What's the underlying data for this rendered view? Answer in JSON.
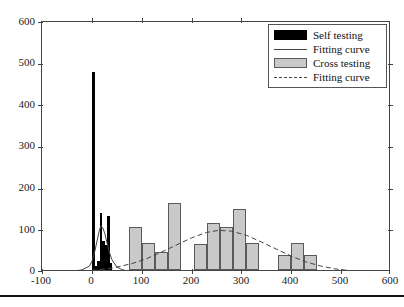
{
  "figure": {
    "background": "#ffffff",
    "frame_color": "#444444"
  },
  "legend": {
    "position": "top-right",
    "items": [
      {
        "label": "Self testing",
        "key": "filled-black-box",
        "color": "#000000"
      },
      {
        "label": "Fitting curve",
        "key": "solid-line",
        "color": "#444444"
      },
      {
        "label": "Cross testing",
        "key": "filled-gray-box",
        "color": "#c9c9c9"
      },
      {
        "label": "Fitting curve",
        "key": "dashed-line",
        "color": "#444444"
      }
    ]
  },
  "axes": {
    "x": {
      "min": -100,
      "max": 600,
      "ticks": [
        -100,
        0,
        100,
        200,
        300,
        400,
        500,
        600
      ],
      "tick_labels": [
        "-100",
        "0",
        "100",
        "200",
        "300",
        "400",
        "500",
        "600"
      ],
      "label": ""
    },
    "y": {
      "min": 0,
      "max": 600,
      "ticks": [
        0,
        100,
        200,
        300,
        400,
        500,
        600
      ],
      "tick_labels": [
        "0",
        "100",
        "200",
        "300",
        "400",
        "500",
        "600"
      ],
      "label": ""
    }
  },
  "chart_data": {
    "type": "bar",
    "title": "",
    "xlabel": "",
    "ylabel": "",
    "xlim": [
      -100,
      600
    ],
    "ylim": [
      0,
      600
    ],
    "grid": false,
    "legend_position": "top-right",
    "series": [
      {
        "name": "Self testing",
        "type": "bar",
        "color": "#000000",
        "bin_width": 5,
        "x": [
          3,
          8,
          13,
          18,
          23,
          28,
          33,
          38
        ],
        "values": [
          475,
          10,
          22,
          138,
          70,
          60,
          130,
          18
        ]
      },
      {
        "name": "Fitting curve",
        "type": "line",
        "style": "solid",
        "color": "#444444",
        "peak_x": 18,
        "peak_y": 110,
        "x": [
          -60,
          -40,
          -20,
          -5,
          0,
          5,
          10,
          15,
          18,
          22,
          26,
          30,
          35,
          40,
          50,
          60,
          70,
          90,
          120,
          160,
          220,
          300,
          400,
          520
        ],
        "values": [
          1,
          2,
          5,
          14,
          25,
          45,
          72,
          100,
          110,
          106,
          92,
          72,
          48,
          30,
          12,
          6,
          3,
          1,
          0.5,
          0.3,
          0.2,
          0.1,
          0.05,
          0
        ]
      },
      {
        "name": "Cross testing",
        "type": "bar",
        "color": "#c9c9c9",
        "edge_color": "#5a5a5a",
        "bin_width": 26,
        "x": [
          88,
          114,
          140,
          166,
          218,
          244,
          270,
          296,
          322,
          387,
          413,
          439
        ],
        "values": [
          104,
          65,
          43,
          161,
          62,
          112,
          103,
          147,
          64,
          36,
          66,
          35
        ]
      },
      {
        "name": "Fitting curve",
        "type": "line",
        "style": "dashed",
        "color": "#444444",
        "peak_x": 255,
        "peak_y": 100,
        "x": [
          -80,
          -40,
          0,
          40,
          80,
          110,
          140,
          170,
          200,
          230,
          255,
          280,
          310,
          340,
          370,
          400,
          430,
          460,
          490,
          520,
          560,
          600
        ],
        "values": [
          1,
          2,
          4,
          9,
          20,
          32,
          48,
          65,
          82,
          95,
          100,
          98,
          88,
          72,
          55,
          38,
          24,
          14,
          7,
          3,
          1,
          0
        ]
      }
    ]
  }
}
